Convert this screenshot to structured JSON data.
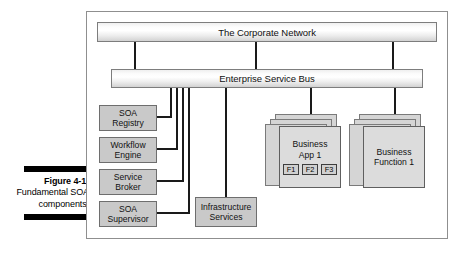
{
  "caption": {
    "figure_label": "Figure 4-1:",
    "body": "Fundamental SOA components."
  },
  "diagram": {
    "title": "Fundamental SOA components",
    "network_bar": {
      "label": "The Corporate Network"
    },
    "bus_bar": {
      "label": "Enterprise Service Bus"
    },
    "components": [
      {
        "id": "soa-registry",
        "line1": "SOA",
        "line2": "Registry"
      },
      {
        "id": "workflow-engine",
        "line1": "Workflow",
        "line2": "Engine"
      },
      {
        "id": "service-broker",
        "line1": "Service",
        "line2": "Broker"
      },
      {
        "id": "soa-supervisor",
        "line1": "SOA",
        "line2": "Supervisor"
      }
    ],
    "infrastructure": {
      "line1": "Infrastructure",
      "line2": "Services"
    },
    "stacks": [
      {
        "id": "business-app-1",
        "line1": "Business",
        "line2": "App 1",
        "functions": [
          "F1",
          "F2",
          "F3"
        ]
      },
      {
        "id": "business-function-1",
        "line1": "Business",
        "line2": "Function 1",
        "functions": []
      }
    ],
    "colors": {
      "frame_border": "#8f8f8f",
      "bar_border": "#7d7d7d",
      "component_fill": "#c9c9c9",
      "card_fill": "#dcdcdc",
      "connector": "#1a1a1a",
      "caption_rule": "#000000"
    }
  }
}
